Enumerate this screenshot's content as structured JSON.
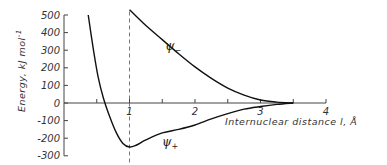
{
  "chart_data": {
    "type": "line",
    "title": "",
    "xlabel": "Internuclear distance l, Å",
    "ylabel": "Energy, kJ mol⁻¹",
    "xlim": [
      0,
      4
    ],
    "ylim": [
      -300,
      500
    ],
    "x_ticks": [
      "1",
      "2",
      "3",
      "4"
    ],
    "x_tick_values": [
      1,
      2,
      3,
      4
    ],
    "x_minor_ticks": [
      0.5,
      1.5,
      2.5,
      3.5
    ],
    "y_ticks": [
      "500",
      "400",
      "300",
      "200",
      "100",
      "0",
      "-100",
      "-200",
      "-300"
    ],
    "y_tick_values": [
      500,
      400,
      300,
      200,
      100,
      0,
      -100,
      -200,
      -300
    ],
    "grid": false,
    "legend": "none (curves labeled inline)",
    "annotations": [
      {
        "type": "vline",
        "x": 1.0,
        "style": "dashed"
      },
      {
        "type": "label",
        "text": "ψ−",
        "near_x": 1.55,
        "near_y": 300
      },
      {
        "type": "label",
        "text": "ψ+",
        "near_x": 1.55,
        "near_y": -230
      }
    ],
    "series": [
      {
        "name": "ψ+",
        "x": [
          0.37,
          0.45,
          0.52,
          0.6,
          0.7,
          0.8,
          0.9,
          1.0,
          1.1,
          1.25,
          1.5,
          1.75,
          2.0,
          2.25,
          2.5,
          2.75,
          3.0,
          3.25,
          3.5
        ],
        "y": [
          500,
          300,
          150,
          30,
          -80,
          -170,
          -230,
          -250,
          -240,
          -210,
          -170,
          -150,
          -125,
          -90,
          -60,
          -35,
          -20,
          -8,
          0
        ]
      },
      {
        "name": "ψ−",
        "x": [
          1.0,
          1.25,
          1.5,
          1.75,
          2.0,
          2.25,
          2.5,
          2.75,
          3.0,
          3.25,
          3.5
        ],
        "y": [
          530,
          440,
          360,
          280,
          205,
          140,
          85,
          45,
          17,
          5,
          0
        ]
      }
    ]
  },
  "labels": {
    "ylabel": "Energy, kJ mol",
    "ylabel_sup": "-1",
    "xlabel": "Internuclear distance  l, Å",
    "psi_minus": "ψ",
    "psi_minus_sub": "−",
    "psi_plus": "ψ",
    "psi_plus_sub": "+"
  }
}
